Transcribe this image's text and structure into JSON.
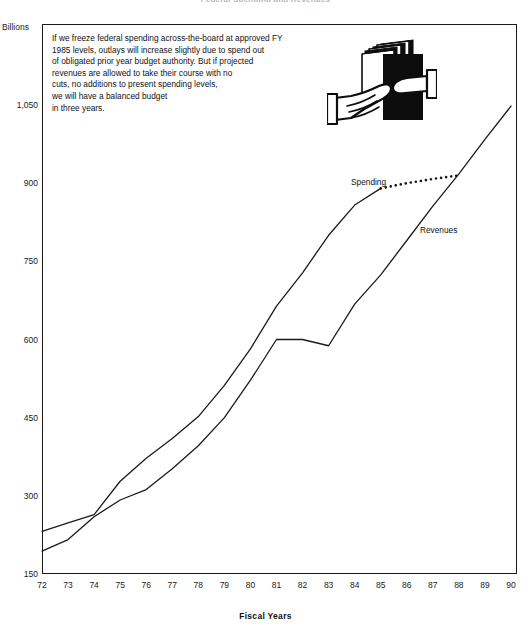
{
  "title": "Federal Spending and Revenues",
  "annotation": {
    "lines": [
      "If we freeze federal spending across-the-board at approved FY",
      "1985 levels, outlays will increase slightly due to spend out",
      "of obligated prior year budget authority. But if projected",
      "revenues are allowed to take their course with no",
      "cuts, no additions to present spending levels,",
      "we will have a balanced budget",
      "in three years."
    ]
  },
  "clipart": {
    "name": "hands-holding-documents",
    "description": "Two hands holding a stack of papers"
  },
  "chart_data": {
    "type": "line",
    "title": "Federal Spending and Revenues",
    "xlabel": "Fiscal Years",
    "ylabel": "Billions",
    "ylim": [
      150,
      1125
    ],
    "xlim": [
      72,
      90
    ],
    "grid": false,
    "legend": "inline-labels",
    "y_ticks": [
      150,
      300,
      450,
      600,
      750,
      900,
      1050
    ],
    "y_tick_labels": [
      "150",
      "300",
      "450",
      "600",
      "750",
      "900",
      "1,050"
    ],
    "x_ticks": [
      72,
      73,
      74,
      75,
      76,
      77,
      78,
      79,
      80,
      81,
      82,
      83,
      84,
      85,
      86,
      87,
      88,
      89,
      90
    ],
    "x_tick_labels": [
      "72",
      "73",
      "74",
      "75",
      "76",
      "77",
      "78",
      "79",
      "80",
      "81",
      "82",
      "83",
      "84",
      "85",
      "86",
      "87",
      "88",
      "89",
      "90"
    ],
    "categories": [
      72,
      73,
      74,
      75,
      76,
      77,
      78,
      79,
      80,
      81,
      82,
      83,
      84,
      85,
      86,
      87,
      88,
      89,
      90
    ],
    "series": [
      {
        "name": "Spending",
        "label": "Spending",
        "style": "solid",
        "x": [
          72,
          73,
          74,
          75,
          76,
          77,
          78,
          79,
          80,
          81,
          82,
          83,
          84,
          85
        ],
        "values": [
          232,
          248,
          264,
          328,
          372,
          410,
          452,
          512,
          582,
          664,
          728,
          800,
          858,
          890
        ]
      },
      {
        "name": "Spending projection",
        "label": "Spending",
        "style": "dotted",
        "x": [
          85,
          86,
          87,
          88
        ],
        "values": [
          890,
          900,
          908,
          915
        ]
      },
      {
        "name": "Revenues",
        "label": "Revenues",
        "style": "solid",
        "x": [
          72,
          73,
          74,
          75,
          76,
          77,
          78,
          79,
          80,
          81,
          82,
          83,
          84,
          85,
          86,
          87,
          88,
          89,
          90
        ],
        "values": [
          194,
          216,
          260,
          292,
          312,
          352,
          396,
          450,
          522,
          600,
          600,
          588,
          668,
          724,
          790,
          856,
          918,
          984,
          1048
        ]
      }
    ],
    "series_labels": [
      {
        "text": "Spending",
        "x_px": 351,
        "y_px": 177
      },
      {
        "text": "Revenues",
        "x_px": 420,
        "y_px": 225
      }
    ]
  },
  "colors": {
    "line": "#1a1a1a",
    "frame": "#1a1a1a",
    "text": "#111111",
    "background": "#ffffff"
  }
}
